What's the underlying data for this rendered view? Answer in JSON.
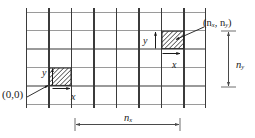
{
  "figure": {
    "type": "diagram",
    "background_color": "#ffffff",
    "grid": {
      "columns": 8,
      "rows": 5,
      "left": 26,
      "top": 12,
      "right": 206,
      "bottom": 104,
      "cell_width": 22.5,
      "cell_height": 18.4,
      "vertical_line_color": "#3b3b3b",
      "horizontal_line_color": "#9a9a9a",
      "line_width": 1
    },
    "cells": [
      {
        "name": "origin-cell",
        "column_index": 1,
        "row_index": 4,
        "x": 48.5,
        "y": 67.2,
        "width": 22.5,
        "height": 18.4,
        "fill": "hatch-diagonal",
        "hatch_color": "#2a2a2a"
      },
      {
        "name": "corner-cell",
        "column_index": 6,
        "row_index": 1,
        "x": 161.0,
        "y": 30.4,
        "width": 22.5,
        "height": 18.4,
        "fill": "hatch-diagonal",
        "hatch_color": "#2a2a2a"
      }
    ],
    "labels": {
      "origin": "(0,0)",
      "corner_open": "(",
      "corner_n1": "n",
      "corner_sub1": "x",
      "corner_comma": ", ",
      "corner_n2": "n",
      "corner_sub2": "y",
      "corner_close": ")",
      "nx_symbol": "n",
      "nx_subscript": "x",
      "ny_symbol": "n",
      "ny_subscript": "y",
      "axis_y_origin": "y",
      "axis_x_origin": "x",
      "axis_y_corner": "y",
      "axis_x_corner": "x"
    },
    "dimension_lines": [
      {
        "name": "nx-dimension",
        "orientation": "horizontal",
        "from_x": 75,
        "to_x": 180,
        "y": 125,
        "label": "n_x",
        "color": "#6f6f6f"
      },
      {
        "name": "ny-dimension",
        "orientation": "vertical",
        "from_y": 31,
        "to_y": 87,
        "x": 228,
        "label": "n_y",
        "color": "#6f6f6f"
      }
    ],
    "leader_lines": [
      {
        "name": "origin-leader",
        "from_x": 26,
        "from_y": 98,
        "to_x": 49,
        "to_y": 85,
        "arrow": "end"
      },
      {
        "name": "corner-leader",
        "from_x": 205,
        "from_y": 27,
        "to_x": 176,
        "to_y": 40,
        "arrow": "end"
      }
    ],
    "colors": {
      "ink": "#1a1a1a",
      "grid_dark": "#3b3b3b",
      "grid_light": "#9a9a9a",
      "dimension": "#6f6f6f",
      "hatch": "#2a2a2a"
    }
  }
}
